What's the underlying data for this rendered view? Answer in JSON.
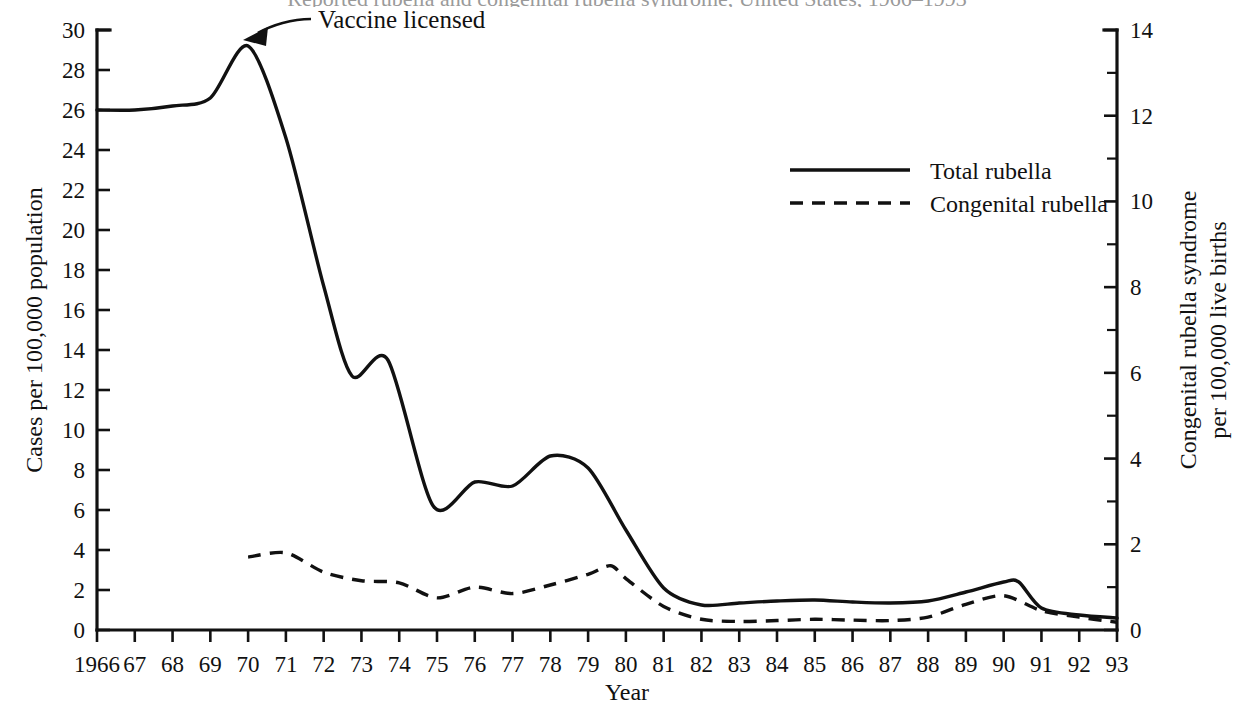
{
  "figure": {
    "clipped_title": "Reported rubella and congenital rubella syndrome, United States, 1966–1993",
    "xaxis_title": "Year",
    "left_axis_title": "Cases per 100,000 population",
    "right_axis_title_line1": "Congenital rubella syndrome",
    "right_axis_title_line2": "per 100,000 live births"
  },
  "annotation": {
    "label": "Vaccine licensed",
    "target_year": 1970,
    "target_value": 29.2
  },
  "legend": {
    "position": "upper-right",
    "items": [
      {
        "label": "Total rubella",
        "style": "solid"
      },
      {
        "label": "Congenital rubella",
        "style": "dashed"
      }
    ]
  },
  "chart_data": {
    "type": "line",
    "title": "Reported rubella and congenital rubella syndrome, United States, 1966–1993",
    "xlabel": "Year",
    "ylabel": "Cases per 100,000 population",
    "y2label": "Congenital rubella syndrome per 100,000 live births",
    "xlim": [
      1966,
      1993
    ],
    "ylim": [
      0,
      30
    ],
    "y2lim": [
      0,
      14
    ],
    "grid": false,
    "legend_position": "upper right",
    "xtick_labels": [
      "1966",
      "67",
      "68",
      "69",
      "70",
      "71",
      "72",
      "73",
      "74",
      "75",
      "76",
      "77",
      "78",
      "79",
      "80",
      "81",
      "82",
      "83",
      "84",
      "85",
      "86",
      "87",
      "88",
      "89",
      "90",
      "91",
      "92",
      "93"
    ],
    "xticks": [
      1966,
      1967,
      1968,
      1969,
      1970,
      1971,
      1972,
      1973,
      1974,
      1975,
      1976,
      1977,
      1978,
      1979,
      1980,
      1981,
      1982,
      1983,
      1984,
      1985,
      1986,
      1987,
      1988,
      1989,
      1990,
      1991,
      1992,
      1993
    ],
    "yticks": [
      0,
      2,
      4,
      6,
      8,
      10,
      12,
      14,
      16,
      18,
      20,
      22,
      24,
      26,
      28,
      30
    ],
    "y2ticks": [
      0,
      2,
      4,
      6,
      8,
      10,
      12,
      14
    ],
    "y2minorticks": [
      1,
      3,
      5,
      7,
      9,
      11,
      13
    ],
    "series": [
      {
        "name": "Total rubella",
        "style": "solid",
        "axis": "left",
        "x": [
          1966,
          1967,
          1968,
          1969,
          1970,
          1971,
          1972,
          1972.75,
          1973.7,
          1974.9,
          1976,
          1977,
          1978,
          1979,
          1980,
          1981,
          1982,
          1983,
          1984,
          1985,
          1986,
          1987,
          1988,
          1989,
          1990,
          1990.4,
          1991,
          1992,
          1993
        ],
        "values": [
          26.0,
          26.0,
          26.2,
          26.6,
          29.2,
          24.6,
          17.2,
          12.7,
          13.5,
          6.2,
          7.4,
          7.2,
          8.7,
          8.1,
          5.0,
          2.1,
          1.25,
          1.35,
          1.45,
          1.5,
          1.4,
          1.35,
          1.45,
          1.9,
          2.4,
          2.4,
          1.1,
          0.75,
          0.6
        ]
      },
      {
        "name": "Congenital rubella",
        "style": "dashed",
        "axis": "right",
        "x": [
          1970,
          1971,
          1972,
          1973,
          1974,
          1975,
          1976,
          1977,
          1978,
          1979,
          1979.6,
          1980,
          1981,
          1982,
          1983,
          1984,
          1985,
          1986,
          1987,
          1988,
          1989,
          1990,
          1991,
          1992,
          1993
        ],
        "values": [
          1.7,
          1.8,
          1.35,
          1.15,
          1.1,
          0.75,
          1.0,
          0.85,
          1.05,
          1.3,
          1.5,
          1.2,
          0.55,
          0.25,
          0.2,
          0.22,
          0.25,
          0.23,
          0.22,
          0.3,
          0.6,
          0.8,
          0.45,
          0.3,
          0.18
        ]
      }
    ]
  }
}
